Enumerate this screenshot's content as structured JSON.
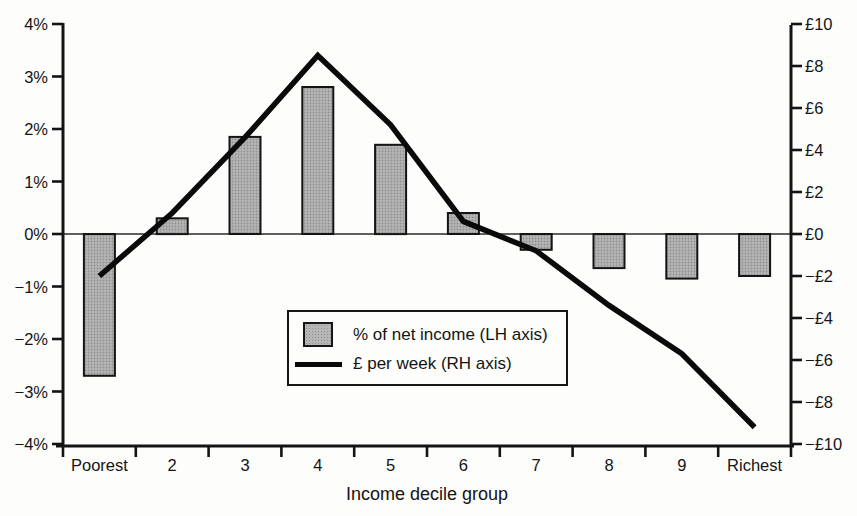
{
  "figure": {
    "background": "#fdfdfc",
    "text_color": "#141414",
    "bar_fill": "#b0b0b0",
    "bar_border": "#161616",
    "line_color": "#0a0a0a"
  },
  "chart_data": {
    "type": "combo-bar-line",
    "categories": [
      "Poorest",
      "2",
      "3",
      "4",
      "5",
      "6",
      "7",
      "8",
      "9",
      "Richest"
    ],
    "series": [
      {
        "name": "% of net income (LH axis)",
        "type": "bar",
        "axis": "left",
        "color": "#b0b0b0",
        "values": [
          -2.7,
          0.3,
          1.85,
          2.8,
          1.7,
          0.4,
          -0.3,
          -0.65,
          -0.85,
          -0.8
        ]
      },
      {
        "name": "£ per week (RH axis)",
        "type": "line",
        "axis": "right",
        "color": "#0a0a0a",
        "values": [
          -2,
          1,
          4.6,
          8.5,
          5.2,
          0.6,
          -0.8,
          -3.4,
          -5.7,
          -9.2
        ]
      }
    ],
    "xlabel": "Income decile group",
    "left_axis": {
      "range": [
        -4,
        4
      ],
      "tick_step": 1,
      "labels": [
        "4%",
        "3%",
        "2%",
        "1%",
        "0%",
        "−1%",
        "−2%",
        "−3%",
        "−4%"
      ]
    },
    "right_axis": {
      "range": [
        -10,
        10
      ],
      "tick_step": 2,
      "labels": [
        "£10",
        "£8",
        "£6",
        "£4",
        "£2",
        "£0",
        "−£2",
        "−£4",
        "−£6",
        "−£8",
        "−£10"
      ]
    },
    "grid": "zero-line-only",
    "legend_position": "inside-lower-middle"
  }
}
